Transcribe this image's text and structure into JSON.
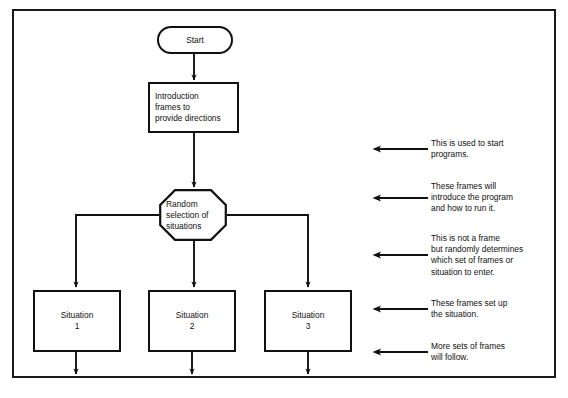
{
  "diagram": {
    "type": "flowchart",
    "frame": {
      "visible": true,
      "color": "#1a1a1a"
    },
    "nodes": {
      "start": {
        "shape": "capsule",
        "label": "Start"
      },
      "introduction": {
        "shape": "rectangle",
        "label": "Introduction\nframes to\nprovide directions"
      },
      "decision": {
        "shape": "octagon",
        "label": "Random\nselection of\nsituations"
      },
      "situation_1": {
        "shape": "rectangle",
        "label": "Situation\n1"
      },
      "situation_2": {
        "shape": "rectangle",
        "label": "Situation\n2"
      },
      "situation_3": {
        "shape": "rectangle",
        "label": "Situation\n3"
      }
    },
    "annotations": [
      {
        "id": "annotation-1",
        "text": "This is used to start\nprograms.",
        "arrow": "left-arrow-icon"
      },
      {
        "id": "annotation-2",
        "text": "These frames will\nintroduce the program\nand how to run it.",
        "arrow": "left-arrow-icon"
      },
      {
        "id": "annotation-3",
        "text": "This is not a frame\nbut randomly determines\nwhich set of frames or\nsituation to enter.",
        "arrow": "left-arrow-icon"
      },
      {
        "id": "annotation-4",
        "text": "These frames set up\nthe situation.",
        "arrow": "left-arrow-icon"
      },
      {
        "id": "annotation-5",
        "text": "More sets of frames\nwill follow.",
        "arrow": "left-arrow-icon"
      }
    ]
  }
}
